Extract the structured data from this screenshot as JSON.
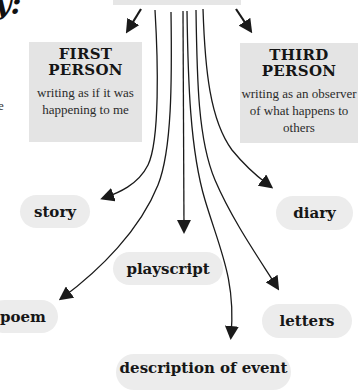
{
  "diagram": {
    "title_fragment": "y:",
    "left_fragment": "e",
    "center_node": {
      "label": ""
    },
    "perspectives": [
      {
        "id": "first-person",
        "heading_line1": "FIRST",
        "heading_line2": "PERSON",
        "description": "writing as if it was happening to me"
      },
      {
        "id": "third-person",
        "heading_line1": "THIRD",
        "heading_line2": "PERSON",
        "description": "writing as an observer of what happens to others"
      }
    ],
    "forms": [
      {
        "id": "story",
        "label": "story"
      },
      {
        "id": "diary",
        "label": "diary"
      },
      {
        "id": "playscript",
        "label": "playscript"
      },
      {
        "id": "poem",
        "label": "poem"
      },
      {
        "id": "letters",
        "label": "letters"
      },
      {
        "id": "description-of-event",
        "label": "description of event"
      }
    ],
    "colors": {
      "box_fill": "#e4e4e4",
      "pill_fill": "#ececec",
      "line": "#1a1a1a"
    }
  }
}
